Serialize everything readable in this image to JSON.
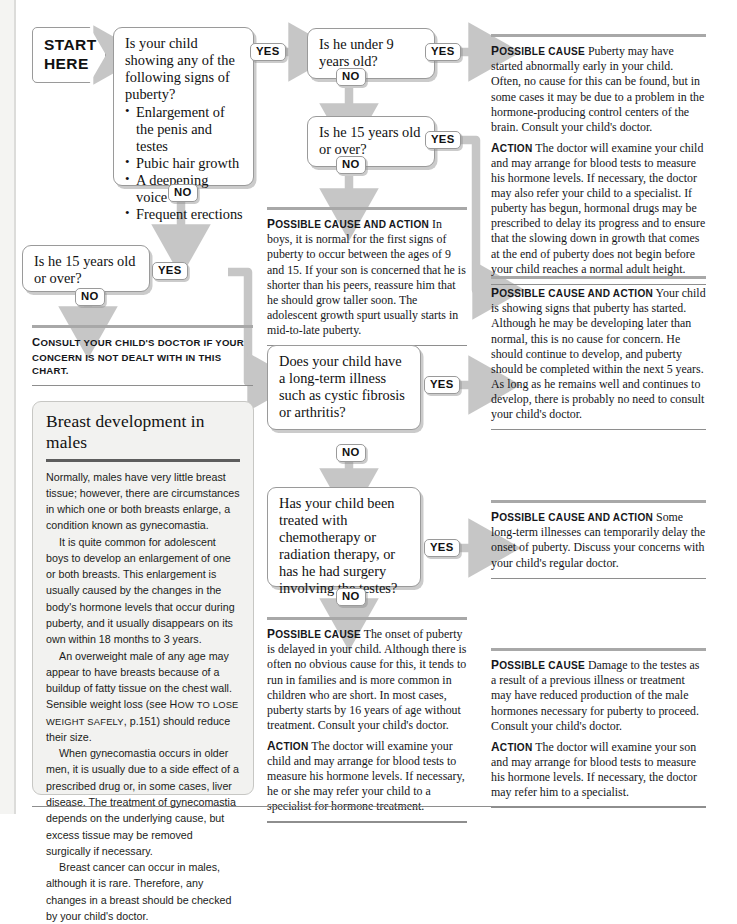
{
  "start": {
    "line1": "START",
    "line2": "HERE"
  },
  "labels": {
    "yes": "YES",
    "no": "NO"
  },
  "questions": {
    "q_signs": {
      "stem": "Is your child showing any of the following signs of puberty?",
      "bullets": [
        "Enlargement of the penis and testes",
        "Pubic hair growth",
        "A deepening voice",
        "Frequent erections"
      ]
    },
    "q_under9": "Is he under 9 years old?",
    "q_15_upper": "Is he 15 years old or over?",
    "q_15_left": "Is he 15 years old or over?",
    "q_longterm": "Does your child have a long-term illness such as cystic fibrosis or arthritis?",
    "q_treatment": "Has your child been treated with chemotherapy or radiation therapy, or has he had surgery involving the testes?"
  },
  "consult_note": {
    "lead_cap": "C",
    "lead_rest": "ONSULT YOUR CHILD'S DOCTOR IF YOUR CONCERN IS NOT DEALT WITH IN THIS CHART."
  },
  "advice": {
    "early_puberty": {
      "cause_lead_cap": "P",
      "cause_lead_rest": "OSSIBLE CAUSE",
      "cause_text": "Puberty may have started abnormally early in your child. Often, no cause for this can be found, but in some cases it may be due to a problem in the hormone-producing control centers of the brain. Consult your child's doctor.",
      "action_lead_cap": "A",
      "action_lead_rest": "CTION",
      "action_text": "The doctor will examine your child and may arrange for blood tests to measure his hormone levels. If necessary, the doctor may also refer your child to a specialist. If puberty has begun, hormonal drugs may be prescribed to delay its progress and to ensure that the slowing down in growth that comes at the end of puberty does not begin before your child reaches a normal adult height."
    },
    "normal_range": {
      "lead_cap": "P",
      "lead_rest": "OSSIBLE CAUSE AND ACTION",
      "text": "In boys, it is normal for the first signs of puberty to occur between the ages of 9 and 15. If your son is concerned that he is shorter than his peers, reassure him that he should grow taller soon. The adolescent growth spurt usually starts in mid-to-late puberty."
    },
    "late_developer": {
      "lead_cap": "P",
      "lead_rest": "OSSIBLE CAUSE AND ACTION",
      "text": "Your child is showing signs that puberty has started. Although he may be developing later than normal, this is no cause for concern. He should continue to develop, and puberty should be completed within the next 5 years. As long as he remains well and continues to develop, there is probably no need to consult your child's doctor."
    },
    "long_term_illness": {
      "lead_cap": "P",
      "lead_rest": "OSSIBLE CAUSE AND ACTION",
      "text": "Some long-term illnesses can temporarily delay the onset of puberty. Discuss your concerns with your child's regular doctor."
    },
    "delayed_puberty": {
      "cause_lead_cap": "P",
      "cause_lead_rest": "OSSIBLE CAUSE",
      "cause_text": "The onset of puberty is delayed in your child. Although there is often no obvious cause for this, it tends to run in families and is more common in children who are short. In most cases, puberty starts by 16 years of age without treatment. Consult your child's doctor.",
      "action_lead_cap": "A",
      "action_lead_rest": "CTION",
      "action_text": "The doctor will examine your child and may arrange for blood tests to measure his hormone levels. If necessary, he or she may refer your child to a specialist for hormone treatment."
    },
    "testes_damage": {
      "cause_lead_cap": "P",
      "cause_lead_rest": "OSSIBLE CAUSE",
      "cause_text": "Damage to the testes as a result of a previous illness or treatment may have reduced production of the male hormones necessary for puberty to proceed. Consult your child's doctor.",
      "action_lead_cap": "A",
      "action_lead_rest": "CTION",
      "action_text": "The doctor will examine your son and may arrange for blood tests to measure his hormone levels. If necessary, the doctor may refer him to a specialist."
    }
  },
  "infobox": {
    "title": "Breast development in males",
    "p1": "Normally, males have very little breast tissue; however, there are circumstances in which one or both breasts enlarge, a condition known as gynecomastia.",
    "p2": "It is quite common for adolescent boys to develop an enlargement of one or both breasts. This enlargement is usually caused by the changes in the body's hormone levels that occur during puberty, and it usually disappears on its own within 18 months to 3 years.",
    "p3a": "An overweight male of any age may appear to have breasts because of a buildup of fatty tissue on the chest wall. Sensible weight loss (see ",
    "p3_ref_cap": "H",
    "p3_ref_rest": "OW TO LOSE WEIGHT SAFELY",
    "p3b": ", p.151) should reduce their size.",
    "p4": "When gynecomastia occurs in older men, it is usually due to a side effect of a prescribed drug or, in some cases, liver disease. The treatment of gynecomastia depends on the underlying cause, but excess tissue may be removed surgically if necessary.",
    "p5": "Breast cancer can occur in males, although it is rare. Therefore, any changes in a breast should be checked by your child's doctor."
  },
  "colors": {
    "connector": "#c6c6c6",
    "rule": "#a8a8a8",
    "infobox_bg": "#f2f2f0"
  }
}
